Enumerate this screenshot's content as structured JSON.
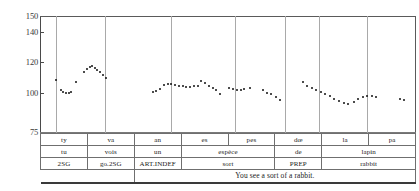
{
  "chart_data": {
    "type": "scatter",
    "title": "",
    "xlabel": "",
    "ylabel": "",
    "ylim": [
      75,
      150
    ],
    "yticks": [
      75,
      100,
      120,
      140,
      150
    ],
    "ytick_labels": [
      "75",
      "100",
      "120",
      "140",
      "150"
    ],
    "grid": "vertical-segment-boundaries",
    "legend": "none",
    "series": [
      {
        "name": "F0 contour (Hz)",
        "points": [
          {
            "x": 0.043,
            "y": 108.5
          },
          {
            "x": 0.055,
            "y": 102.0
          },
          {
            "x": 0.062,
            "y": 100.6
          },
          {
            "x": 0.069,
            "y": 100.4
          },
          {
            "x": 0.076,
            "y": 100.4
          },
          {
            "x": 0.083,
            "y": 100.6
          },
          {
            "x": 0.096,
            "y": 107.5
          },
          {
            "x": 0.118,
            "y": 114.0
          },
          {
            "x": 0.125,
            "y": 116.0
          },
          {
            "x": 0.132,
            "y": 117.3
          },
          {
            "x": 0.139,
            "y": 117.6
          },
          {
            "x": 0.146,
            "y": 116.6
          },
          {
            "x": 0.153,
            "y": 115.0
          },
          {
            "x": 0.16,
            "y": 113.6
          },
          {
            "x": 0.167,
            "y": 112.0
          },
          {
            "x": 0.177,
            "y": 109.6
          },
          {
            "x": 0.3,
            "y": 100.8
          },
          {
            "x": 0.31,
            "y": 101.8
          },
          {
            "x": 0.32,
            "y": 103.0
          },
          {
            "x": 0.33,
            "y": 105.4
          },
          {
            "x": 0.34,
            "y": 106.2
          },
          {
            "x": 0.35,
            "y": 106.0
          },
          {
            "x": 0.36,
            "y": 105.4
          },
          {
            "x": 0.37,
            "y": 104.8
          },
          {
            "x": 0.38,
            "y": 104.6
          },
          {
            "x": 0.39,
            "y": 104.4
          },
          {
            "x": 0.4,
            "y": 104.4
          },
          {
            "x": 0.41,
            "y": 104.6
          },
          {
            "x": 0.42,
            "y": 104.8
          },
          {
            "x": 0.43,
            "y": 107.8
          },
          {
            "x": 0.44,
            "y": 106.4
          },
          {
            "x": 0.45,
            "y": 105.0
          },
          {
            "x": 0.46,
            "y": 103.6
          },
          {
            "x": 0.47,
            "y": 102.0
          },
          {
            "x": 0.48,
            "y": 99.4
          },
          {
            "x": 0.505,
            "y": 103.6
          },
          {
            "x": 0.515,
            "y": 102.6
          },
          {
            "x": 0.525,
            "y": 102.4
          },
          {
            "x": 0.535,
            "y": 102.4
          },
          {
            "x": 0.545,
            "y": 102.6
          },
          {
            "x": 0.56,
            "y": 103.6
          },
          {
            "x": 0.595,
            "y": 102.0
          },
          {
            "x": 0.606,
            "y": 100.4
          },
          {
            "x": 0.617,
            "y": 99.4
          },
          {
            "x": 0.628,
            "y": 97.8
          },
          {
            "x": 0.64,
            "y": 96.0
          },
          {
            "x": 0.7,
            "y": 107.4
          },
          {
            "x": 0.712,
            "y": 105.0
          },
          {
            "x": 0.724,
            "y": 103.4
          },
          {
            "x": 0.736,
            "y": 102.0
          },
          {
            "x": 0.748,
            "y": 100.6
          },
          {
            "x": 0.76,
            "y": 99.4
          },
          {
            "x": 0.772,
            "y": 98.2
          },
          {
            "x": 0.784,
            "y": 96.6
          },
          {
            "x": 0.796,
            "y": 95.0
          },
          {
            "x": 0.81,
            "y": 93.6
          },
          {
            "x": 0.822,
            "y": 93.4
          },
          {
            "x": 0.836,
            "y": 94.2
          },
          {
            "x": 0.848,
            "y": 96.6
          },
          {
            "x": 0.86,
            "y": 97.8
          },
          {
            "x": 0.872,
            "y": 98.0
          },
          {
            "x": 0.884,
            "y": 98.0
          },
          {
            "x": 0.896,
            "y": 97.8
          },
          {
            "x": 0.96,
            "y": 96.4
          },
          {
            "x": 0.97,
            "y": 95.6
          }
        ]
      }
    ],
    "segment_boundaries": [
      0.043,
      0.173,
      0.348,
      0.521,
      0.654,
      0.745,
      0.872
    ]
  },
  "annotation": {
    "rows": [
      {
        "name": "phonetic-tier",
        "cells": [
          {
            "text": "ty",
            "span": 1
          },
          {
            "text": "va",
            "span": 1
          },
          {
            "text": "an",
            "span": 1
          },
          {
            "text": "es",
            "span": 1
          },
          {
            "text": "pes",
            "span": 1
          },
          {
            "text": "dœ",
            "span": 1
          },
          {
            "text": "la",
            "span": 1
          },
          {
            "text": "pa",
            "span": 1
          }
        ]
      },
      {
        "name": "orthographic-tier",
        "cells": [
          {
            "text": "tu",
            "span": 1
          },
          {
            "text": "vois",
            "span": 1
          },
          {
            "text": "un",
            "span": 1
          },
          {
            "text": "espèce",
            "span": 2
          },
          {
            "text": "de",
            "span": 1
          },
          {
            "text": "lapin",
            "span": 2
          }
        ]
      },
      {
        "name": "gloss-tier",
        "cells": [
          {
            "text": "2SG",
            "span": 1
          },
          {
            "text": "go.2SG",
            "span": 1
          },
          {
            "text": "ART.INDEF",
            "span": 1
          },
          {
            "text": "sort",
            "span": 2
          },
          {
            "text": "PREP",
            "span": 1
          },
          {
            "text": "rabbit",
            "span": 2
          }
        ]
      }
    ],
    "translation": "You see a sort of a rabbit."
  },
  "colors": {
    "point": "#111111",
    "axis": "#4a4a4a",
    "grid": "#a9a9a9",
    "table_border": "#6f6f6f",
    "text": "#1a1a1a"
  }
}
